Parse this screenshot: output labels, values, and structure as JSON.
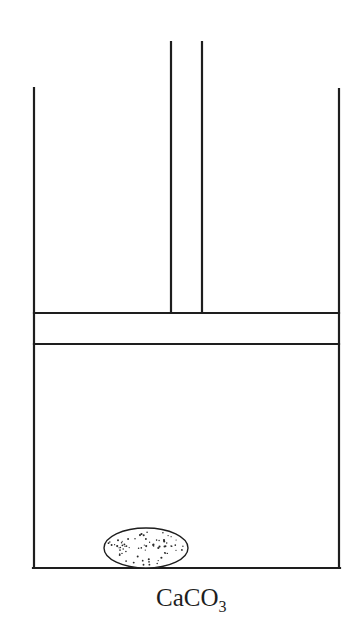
{
  "diagram": {
    "type": "piston-cylinder apparatus",
    "stroke_color": "#1e1e1e",
    "background": "#ffffff",
    "components": {
      "cylinder": {
        "left_x": 34,
        "right_x": 339,
        "top_y": 88,
        "bottom_y": 568
      },
      "piston": {
        "top_y": 313,
        "bottom_y": 344
      },
      "rod": {
        "left_x": 171,
        "right_x": 202,
        "top_y": 42
      },
      "solid_sample": {
        "cx": 146,
        "cy": 549,
        "rx": 42,
        "ry": 20,
        "fill_pattern": "dotted"
      }
    },
    "label": {
      "main": "CaCO",
      "subscript": "3"
    }
  }
}
